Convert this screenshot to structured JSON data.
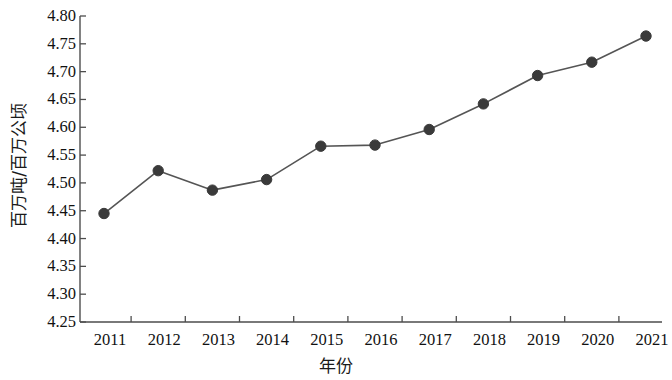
{
  "chart_data": {
    "type": "line",
    "title": "",
    "xlabel": "年份",
    "ylabel": "百万吨/百万公顷",
    "categories": [
      "2011",
      "2012",
      "2013",
      "2014",
      "2015",
      "2016",
      "2017",
      "2018",
      "2019",
      "2020",
      "2021"
    ],
    "x": [
      2011,
      2012,
      2013,
      2014,
      2015,
      2016,
      2017,
      2018,
      2019,
      2020,
      2021
    ],
    "values": [
      4.445,
      4.522,
      4.487,
      4.506,
      4.566,
      4.568,
      4.596,
      4.642,
      4.693,
      4.717,
      4.764
    ],
    "series": [
      {
        "name": "百万吨/百万公顷",
        "values": [
          4.445,
          4.522,
          4.487,
          4.506,
          4.566,
          4.568,
          4.596,
          4.642,
          4.693,
          4.717,
          4.764
        ]
      }
    ],
    "ylim": [
      4.25,
      4.8
    ],
    "xlim": [
      2010.6,
      2021.2
    ],
    "ytick_labels": [
      "4.80",
      "4.75",
      "4.70",
      "4.65",
      "4.60",
      "4.55",
      "4.50",
      "4.45",
      "4.40",
      "4.35",
      "4.30",
      "4.25"
    ],
    "ytick_values": [
      4.8,
      4.75,
      4.7,
      4.65,
      4.6,
      4.55,
      4.5,
      4.45,
      4.4,
      4.35,
      4.3,
      4.25
    ],
    "xtick_labels": [
      "2011",
      "2012",
      "2013",
      "2014",
      "2015",
      "2016",
      "2017",
      "2018",
      "2019",
      "2020",
      "2021"
    ],
    "grid": false,
    "legend": false,
    "legend_position": "none",
    "marker": "circle",
    "marker_color": "#3a3a3a",
    "line_color": "#555555",
    "axis_color": "#4d4d4d",
    "background_color": "#ffffff"
  },
  "axes": {
    "y_title": "百万吨/百万公顷",
    "x_title": "年份"
  }
}
